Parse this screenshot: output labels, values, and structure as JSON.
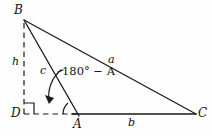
{
  "figure": {
    "type": "geometry-diagram",
    "background_color": "#fefefe",
    "stroke_color": "#1a1a1a",
    "vertices": [
      {
        "id": "B",
        "label": "B",
        "x": 24,
        "y": 20,
        "label_x": 14,
        "label_y": 4
      },
      {
        "id": "A",
        "label": "A",
        "x": 78,
        "y": 114,
        "label_x": 73,
        "label_y": 118
      },
      {
        "id": "C",
        "label": "C",
        "x": 196,
        "y": 114,
        "label_x": 198,
        "label_y": 106
      },
      {
        "id": "D",
        "label": "D",
        "x": 24,
        "y": 114,
        "label_x": 11,
        "label_y": 107
      }
    ],
    "sides": [
      {
        "id": "a",
        "label": "a",
        "from": "B",
        "to": "C",
        "style": "solid",
        "label_x": 108,
        "label_y": 54
      },
      {
        "id": "b",
        "label": "b",
        "from": "A",
        "to": "C",
        "style": "solid",
        "label_x": 128,
        "label_y": 117
      },
      {
        "id": "c",
        "label": "c",
        "from": "B",
        "to": "A",
        "style": "solid",
        "label_x": 40,
        "label_y": 65
      },
      {
        "id": "h",
        "label": "h",
        "from": "B",
        "to": "D",
        "style": "dashed",
        "label_x": 12,
        "label_y": 56
      },
      {
        "id": "DA",
        "label": "",
        "from": "D",
        "to": "A",
        "style": "dashed",
        "label_x": 0,
        "label_y": 0
      }
    ],
    "angles": [
      {
        "id": "exterior-angle-at-A",
        "text_prefix": "180",
        "text_degree": "°",
        "text_minus": "−",
        "text_suffix": "A",
        "full_text": "180° − A",
        "at_vertex": "A",
        "label_x": 62,
        "label_y": 66,
        "marker": "arc-with-arrowhead"
      },
      {
        "id": "right-angle-at-D",
        "full_text": "",
        "at_vertex": "D",
        "marker": "square"
      },
      {
        "id": "interior-angle-at-A",
        "full_text": "",
        "at_vertex": "A",
        "marker": "small-arc"
      }
    ]
  }
}
